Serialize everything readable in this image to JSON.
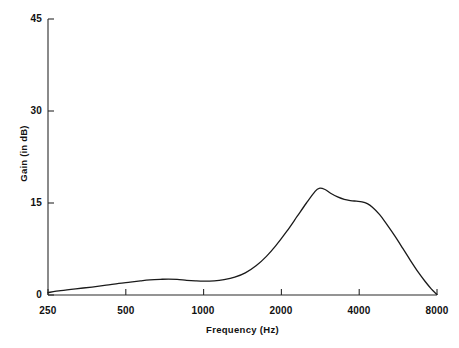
{
  "chart_data": {
    "type": "line",
    "title": "",
    "xlabel": "Frequency (Hz)",
    "ylabel": "Gain (in dB)",
    "xscale": "log",
    "xlim": [
      250,
      8000
    ],
    "ylim": [
      0,
      45
    ],
    "xticks": [
      250,
      500,
      1000,
      2000,
      4000,
      8000
    ],
    "xtick_labels": [
      "250",
      "500",
      "1000",
      "2000",
      "4000",
      "8000"
    ],
    "yticks": [
      0,
      15,
      30,
      45
    ],
    "ytick_labels": [
      "0",
      "15",
      "30",
      "45"
    ],
    "grid": false,
    "legend": null,
    "series": [
      {
        "name": "Gain",
        "color": "#1a1a1a",
        "x": [
          250,
          280,
          320,
          370,
          420,
          470,
          520,
          570,
          620,
          680,
          730,
          790,
          860,
          930,
          1000,
          1100,
          1200,
          1320,
          1450,
          1600,
          1750,
          1900,
          2100,
          2300,
          2500,
          2700,
          2800,
          2950,
          3100,
          3300,
          3500,
          3700,
          3900,
          4100,
          4300,
          4500,
          4800,
          5100,
          5500,
          5900,
          6300,
          6800,
          7200,
          7600,
          7900,
          8000
        ],
        "y": [
          0.4,
          0.7,
          1.0,
          1.3,
          1.6,
          1.9,
          2.1,
          2.3,
          2.45,
          2.55,
          2.6,
          2.55,
          2.4,
          2.3,
          2.25,
          2.3,
          2.5,
          2.9,
          3.6,
          4.8,
          6.3,
          8.0,
          10.4,
          12.8,
          15.0,
          16.9,
          17.4,
          17.2,
          16.6,
          16.0,
          15.6,
          15.4,
          15.3,
          15.2,
          14.9,
          14.3,
          13.1,
          11.6,
          9.6,
          7.6,
          5.7,
          3.6,
          2.2,
          1.0,
          0.3,
          0.1
        ]
      }
    ]
  },
  "axes": {
    "y_title": "Gain (in dB)",
    "x_title": "Frequency (Hz)"
  }
}
